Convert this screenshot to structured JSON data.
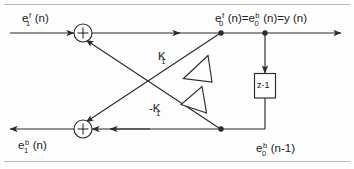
{
  "figure": {
    "type": "signal-flow-diagram",
    "line_color": "#2b2b2b",
    "text_color": "#1a1a1a",
    "background": "#fdfdfd"
  },
  "labels": {
    "input_forward": {
      "base": "e",
      "sup": "f",
      "sub": "1",
      "arg": "(n)",
      "full": "e1f(n)"
    },
    "output_backward": {
      "base": "e",
      "sup": "b",
      "sub": "1",
      "arg": "(n)",
      "full": "e1b(n)"
    },
    "output_top": {
      "term1": {
        "base": "e",
        "sup": "f",
        "sub": "0",
        "arg": "(n)"
      },
      "eq1": "=",
      "term2": {
        "base": "e",
        "sup": "b",
        "sub": "0",
        "arg": "(n)"
      },
      "eq2": "=",
      "term3": "y (n)",
      "full": "e0f(n) = e0b(n) = y(n)"
    },
    "delayed_backward": {
      "base": "e",
      "sup": "b",
      "sub": "0",
      "arg": "(n-1)",
      "full": "e0b(n-1)"
    }
  },
  "gains": {
    "upper": "K",
    "upper_sub": "1",
    "upper_full": "K1",
    "lower": "-K",
    "lower_sub": "1",
    "lower_full": "-K1"
  },
  "blocks": {
    "delay": {
      "label": "z-1",
      "name": "unit-delay"
    }
  },
  "adders": {
    "top": {
      "symbol": "+",
      "name": "forward-summing-junction"
    },
    "bottom": {
      "symbol": "+",
      "name": "backward-summing-junction"
    }
  }
}
